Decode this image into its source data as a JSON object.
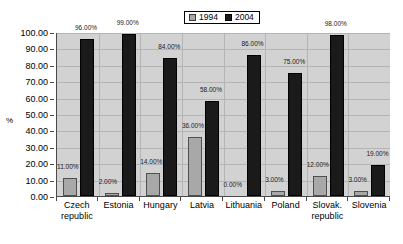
{
  "chart_data": {
    "type": "bar",
    "title": "",
    "xlabel": "",
    "ylabel": "%",
    "ylim": [
      0,
      100
    ],
    "ytick_step": 10,
    "grid": true,
    "legend_position": "top-center",
    "categories": [
      "Czech republic",
      "Estonia",
      "Hungary",
      "Latvia",
      "Lithuania",
      "Poland",
      "Slovak. republic",
      "Slovenia"
    ],
    "category_lines": [
      [
        "Czech",
        "republic"
      ],
      [
        "Estonia"
      ],
      [
        "Hungary"
      ],
      [
        "Latvia"
      ],
      [
        "Lithuania"
      ],
      [
        "Poland"
      ],
      [
        "Slovak.",
        "republic"
      ],
      [
        "Slovenia"
      ]
    ],
    "series": [
      {
        "name": "1994",
        "color": "#a8a8a8",
        "values": [
          11,
          2,
          14,
          36,
          0,
          3,
          12,
          3
        ],
        "labels": [
          "11.00%",
          "2.00%",
          "14.00%",
          "36.00%",
          "0.00%",
          "3.00%",
          "12.00%",
          "3.00%"
        ]
      },
      {
        "name": "2004",
        "color": "#1a1a1a",
        "values": [
          96,
          99,
          84,
          58,
          86,
          75,
          98,
          19
        ],
        "labels": [
          "96.00%",
          "99.00%",
          "84.00%",
          "58.00%",
          "86.00%",
          "75.00%",
          "98.00%",
          "19.00%"
        ]
      }
    ],
    "ytick_labels": [
      "100.00",
      "90.00",
      "80.00",
      "70.00",
      "60.00",
      "50.00",
      "40.00",
      "30.00",
      "20.00",
      "10.00",
      "0.00"
    ]
  },
  "legend": {
    "entries": [
      {
        "label": "1994"
      },
      {
        "label": "2004"
      }
    ]
  },
  "colors": {
    "series_1994": "#a8a8a8",
    "series_2004": "#1a1a1a",
    "plot_background": "#d2d2d2",
    "gridline": "#b4b4b4",
    "axis": "#4a4a4a",
    "page_background": "#ffffff"
  }
}
